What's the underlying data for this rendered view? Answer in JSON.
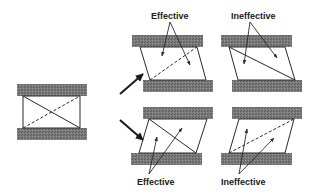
{
  "labels": {
    "top_effective": "Effective",
    "top_ineffective": "Ineffective",
    "bottom_effective": "Effective",
    "bottom_ineffective": "Ineffective"
  },
  "colors": {
    "plate": "#6f6f6f",
    "line": "#2a2a2a",
    "background": "#ffffff"
  }
}
